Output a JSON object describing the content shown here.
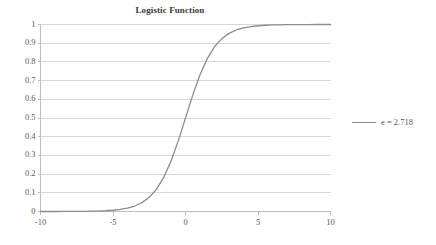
{
  "chart_data": {
    "type": "line",
    "title": "Logistic Function",
    "xlabel": "",
    "ylabel": "",
    "xlim": [
      -10,
      10
    ],
    "ylim": [
      0,
      1
    ],
    "grid": true,
    "legend_position": "right",
    "x_ticks": [
      "-10",
      "-5",
      "0",
      "5",
      "10"
    ],
    "x_tick_values": [
      -10,
      -5,
      0,
      5,
      10
    ],
    "y_ticks": [
      "0",
      "0.1",
      "0.2",
      "0.3",
      "0.4",
      "0.5",
      "0.6",
      "0.7",
      "0.8",
      "0.9",
      "1"
    ],
    "y_tick_values": [
      0,
      0.1,
      0.2,
      0.3,
      0.4,
      0.5,
      0.6,
      0.7,
      0.8,
      0.9,
      1
    ],
    "series": [
      {
        "name": "e = 2.718",
        "color": "#8c8c8c",
        "x": [
          -10,
          -9.5,
          -9,
          -8.5,
          -8,
          -7.5,
          -7,
          -6.5,
          -6,
          -5.5,
          -5,
          -4.5,
          -4,
          -3.5,
          -3,
          -2.5,
          -2,
          -1.5,
          -1,
          -0.5,
          0,
          0.5,
          1,
          1.5,
          2,
          2.5,
          3,
          3.5,
          4,
          4.5,
          5,
          5.5,
          6,
          6.5,
          7,
          7.5,
          8,
          8.5,
          9,
          9.5,
          10
        ],
        "values": [
          4.54e-05,
          7.49e-05,
          0.0001234,
          0.0002035,
          0.0003354,
          0.0005527,
          0.0009111,
          0.0015017,
          0.0024726,
          0.0040701,
          0.0066929,
          0.0109869,
          0.0179862,
          0.0293122,
          0.0474259,
          0.0758582,
          0.1192029,
          0.1824255,
          0.2689414,
          0.3775407,
          0.5,
          0.6224593,
          0.7310586,
          0.8175745,
          0.8807971,
          0.9241418,
          0.9525741,
          0.9706878,
          0.9820138,
          0.9890131,
          0.9933071,
          0.9959299,
          0.9975274,
          0.9984983,
          0.9990889,
          0.9994473,
          0.9996646,
          0.9997965,
          0.9998766,
          0.9999251,
          0.9999546
        ]
      }
    ],
    "legend": [
      {
        "label": "e = 2.718",
        "color": "#8c8c8c"
      }
    ],
    "colors": {
      "line": "#8c8c8c",
      "grid": "#d9d9d9",
      "axis": "#bfbfbf",
      "text": "#5a5a5a",
      "title": "#3a3a3a",
      "background": "#ffffff"
    }
  }
}
